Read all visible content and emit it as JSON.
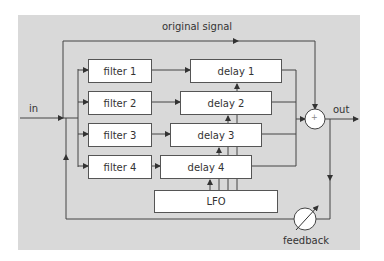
{
  "diagram": {
    "labels": {
      "input": "in",
      "output": "out",
      "original_signal": "original signal",
      "feedback": "feedback",
      "summer_symbol": "+"
    },
    "filters": [
      {
        "label": "filter 1"
      },
      {
        "label": "filter 2"
      },
      {
        "label": "filter  3"
      },
      {
        "label": "filter 4"
      }
    ],
    "delays": [
      {
        "label": "delay 1"
      },
      {
        "label": "delay 2"
      },
      {
        "label": "delay 3"
      },
      {
        "label": "delay 4"
      }
    ],
    "lfo": {
      "label": "LFO"
    },
    "colors": {
      "panel": "#d9d9d9",
      "line": "#444444",
      "box": "#ffffff"
    }
  }
}
